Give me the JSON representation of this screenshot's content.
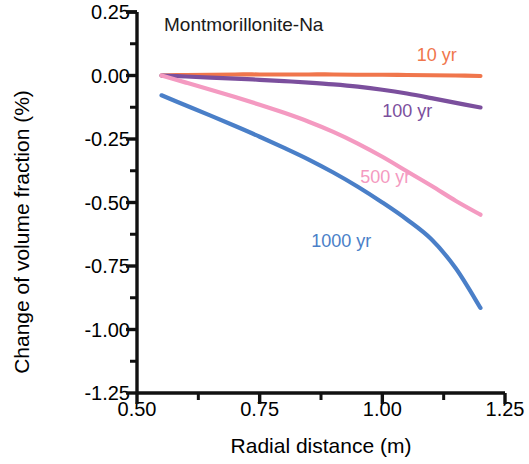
{
  "chart_data": {
    "type": "line",
    "title": "Montmorillonite-Na",
    "xlabel": "Radial distance (m)",
    "ylabel": "Change of volume fraction (%)",
    "xlim": [
      0.5,
      1.25
    ],
    "ylim": [
      -1.25,
      0.25
    ],
    "xticks": [
      0.5,
      0.75,
      1.0,
      1.25
    ],
    "xtick_labels": [
      "0.50",
      "0.75",
      "1.00",
      "1.25"
    ],
    "xminor_ticks": [
      0.625,
      0.875,
      1.125
    ],
    "yticks": [
      0.25,
      0.0,
      -0.25,
      -0.5,
      -0.75,
      -1.0,
      -1.25
    ],
    "ytick_labels": [
      "0.25",
      "0.00",
      "-0.25",
      "-0.50",
      "-0.75",
      "-1.00",
      "-1.25"
    ],
    "yminor_ticks": [
      0.125,
      -0.125,
      -0.375,
      -0.625,
      -0.875,
      -1.125
    ],
    "grid": false,
    "legend_position": "inline-annotations",
    "series": [
      {
        "name": "10 yr",
        "color": "#F0764C",
        "label_x": 1.07,
        "label_y": 0.075,
        "x": [
          0.55,
          0.6,
          0.65,
          0.7,
          0.75,
          0.8,
          0.85,
          0.9,
          0.95,
          1.0,
          1.05,
          1.1,
          1.15,
          1.2
        ],
        "y": [
          0.0,
          0.002,
          0.003,
          0.004,
          0.004,
          0.004,
          0.004,
          0.004,
          0.003,
          0.003,
          0.002,
          0.001,
          0.0,
          -0.002
        ]
      },
      {
        "name": "100 yr",
        "color": "#7B4F9D",
        "label_x": 1.0,
        "label_y": -0.145,
        "x": [
          0.55,
          0.6,
          0.65,
          0.7,
          0.75,
          0.8,
          0.85,
          0.9,
          0.95,
          1.0,
          1.05,
          1.1,
          1.15,
          1.2
        ],
        "y": [
          0.0,
          -0.004,
          -0.008,
          -0.012,
          -0.017,
          -0.022,
          -0.028,
          -0.035,
          -0.044,
          -0.056,
          -0.071,
          -0.089,
          -0.108,
          -0.126
        ]
      },
      {
        "name": "500 yr",
        "color": "#F49AC1",
        "label_x": 0.955,
        "label_y": -0.405,
        "x": [
          0.55,
          0.6,
          0.65,
          0.7,
          0.75,
          0.8,
          0.85,
          0.9,
          0.95,
          1.0,
          1.05,
          1.1,
          1.15,
          1.2
        ],
        "y": [
          0.0,
          -0.028,
          -0.056,
          -0.085,
          -0.115,
          -0.147,
          -0.182,
          -0.222,
          -0.268,
          -0.32,
          -0.377,
          -0.434,
          -0.494,
          -0.548
        ]
      },
      {
        "name": "1000 yr",
        "color": "#4A7FC8",
        "label_x": 0.855,
        "label_y": -0.655,
        "x": [
          0.55,
          0.6,
          0.65,
          0.7,
          0.75,
          0.8,
          0.85,
          0.9,
          0.95,
          1.0,
          1.05,
          1.1,
          1.15,
          1.2
        ],
        "y": [
          -0.078,
          -0.118,
          -0.158,
          -0.199,
          -0.241,
          -0.285,
          -0.331,
          -0.382,
          -0.438,
          -0.5,
          -0.567,
          -0.645,
          -0.76,
          -0.915
        ]
      }
    ]
  }
}
